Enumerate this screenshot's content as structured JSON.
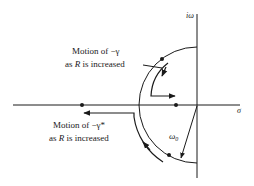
{
  "diagram": {
    "axes": {
      "imag_label": "iω",
      "real_label": "σ"
    },
    "radius_label_main": "ω",
    "radius_label_sub": "0",
    "annotations": [
      {
        "line1": "Motion of −γ",
        "line2_pre": "as ",
        "line2_var": "R",
        "line2_post": " is increased"
      },
      {
        "line1": "Motion of −γ*",
        "line2_pre": "as ",
        "line2_var": "R",
        "line2_post": " is increased"
      }
    ],
    "colors": {
      "ink": "#1a1a1a",
      "background": "#ffffff"
    }
  }
}
